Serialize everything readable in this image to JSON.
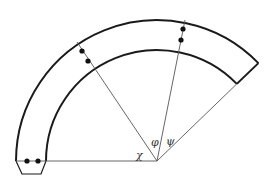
{
  "diagram": {
    "colors": {
      "stroke": "#1a1a1a",
      "thin_line": "#555555",
      "background": "#ffffff"
    },
    "center": {
      "x": 157,
      "y": 161
    },
    "arcs": {
      "outer_radius": 141,
      "inner_radius": 111,
      "start_angle_deg": 180,
      "end_angle_deg": 44
    },
    "labels": {
      "chi": "χ",
      "phi": "φ",
      "psi": "ψ"
    }
  }
}
